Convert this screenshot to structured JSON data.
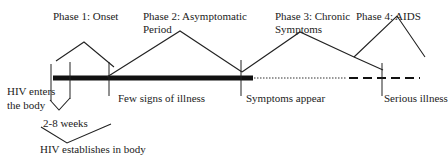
{
  "diagram": {
    "phases": [
      {
        "label_line1": "Phase 1: Onset",
        "label_line2": ""
      },
      {
        "label_line1": "Phase 2: Asymptomatic",
        "label_line2": "Period"
      },
      {
        "label_line1": "Phase 3: Chronic",
        "label_line2": "Symptoms"
      },
      {
        "label_line1": "Phase 4: AIDS",
        "label_line2": ""
      }
    ],
    "timeline_markers": [
      {
        "label_line1": "HIV enters",
        "label_line2": "the body"
      },
      {
        "label": "Few signs of illness"
      },
      {
        "label": "Symptoms appear"
      },
      {
        "label": "Serious illness"
      }
    ],
    "interval": {
      "label": "2-8 weeks"
    },
    "establish": {
      "label": "HIV establishes in body"
    },
    "timeline_styles": [
      "thick solid",
      "dotted",
      "dashed"
    ],
    "colors": {
      "line": "#1a1a1a",
      "text": "#222222",
      "background": "#ffffff"
    }
  }
}
